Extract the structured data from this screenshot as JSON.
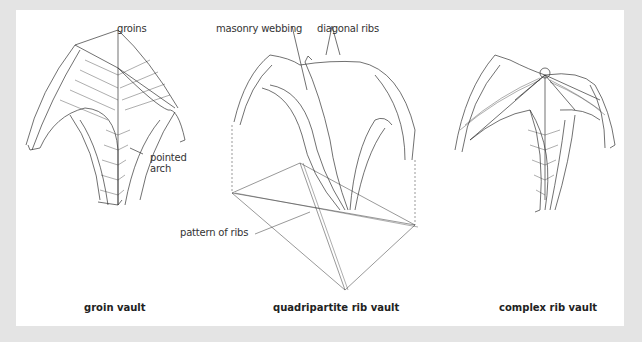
{
  "figure": {
    "background_color": "#e4e4e4",
    "panel_color": "#ffffff",
    "line_color": "#333333",
    "panels": [
      {
        "id": "groin-vault",
        "caption": "groin vault",
        "labels": [
          "groins",
          "pointed arch"
        ]
      },
      {
        "id": "quadripartite-rib-vault",
        "caption": "quadripartite rib vault",
        "labels": [
          "masonry webbing",
          "diagonal ribs",
          "pattern of ribs"
        ]
      },
      {
        "id": "complex-rib-vault",
        "caption": "complex rib vault",
        "labels": []
      }
    ]
  }
}
